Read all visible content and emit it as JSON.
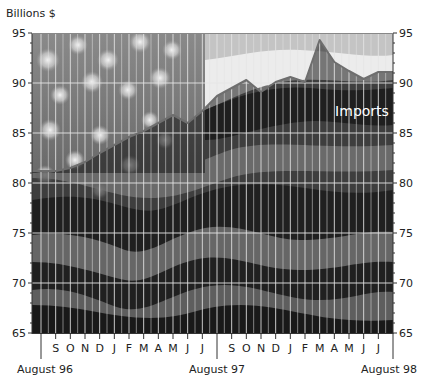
{
  "chart_data": {
    "type": "line",
    "title": "",
    "series_label": "Imports",
    "ylabel": "Billions $",
    "xlabel": "",
    "ylim": [
      65,
      95
    ],
    "yticks": [
      65,
      70,
      75,
      80,
      85,
      90,
      95
    ],
    "grid": true,
    "background": "waving US flag photograph (grayscale)",
    "x_month_ticks": [
      "S",
      "O",
      "N",
      "D",
      "J",
      "F",
      "M",
      "A",
      "M",
      "J",
      "J",
      "S",
      "O",
      "N",
      "D",
      "J",
      "F",
      "M",
      "A",
      "M",
      "J",
      "J"
    ],
    "x_major_labels": [
      "August 96",
      "August 97",
      "August 98"
    ],
    "x": [
      "Jul 96",
      "Aug 96",
      "Sep 96",
      "Oct 96",
      "Nov 96",
      "Dec 96",
      "Jan 97",
      "Feb 97",
      "Mar 97",
      "Apr 97",
      "May 97",
      "Jun 97",
      "Jul 97",
      "Aug 97",
      "Sep 97",
      "Oct 97",
      "Nov 97",
      "Dec 97",
      "Jan 98",
      "Feb 98",
      "Mar 98",
      "Apr 98",
      "May 98",
      "Jun 98",
      "Jul 98",
      "Aug 98"
    ],
    "series": [
      {
        "name": "Imports",
        "values": [
          81.2,
          81.2,
          81.2,
          81.5,
          82.1,
          83.0,
          83.8,
          84.6,
          85.2,
          86.0,
          86.8,
          86.0,
          87.2,
          88.7,
          89.5,
          90.3,
          89.1,
          90.1,
          90.6,
          90.1,
          94.3,
          92.1,
          91.2,
          90.4,
          91.1,
          91.1
        ]
      }
    ],
    "annotations": [
      {
        "text": "Imports",
        "x": "May 98",
        "y": 87.7
      }
    ]
  },
  "labels": {
    "unit": "Billions $",
    "series_label": "Imports"
  },
  "colors": {
    "line": "#6e6e6e",
    "grid": "#e6e6e6",
    "axis": "#333333",
    "label_on_flag": "#ffffff"
  }
}
